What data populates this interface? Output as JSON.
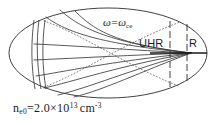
{
  "figure": {
    "name": "plasma-resonance-ray-diagram",
    "caption": {
      "symbol": "n",
      "symbol_subscript": "e0",
      "equals": "=",
      "mantissa": "2.0",
      "times": "×",
      "base": "10",
      "exponent": "13",
      "unit": "cm",
      "unit_exponent": "-3",
      "full_text": "n_e0 = 2.0 × 10^13 cm^-3"
    },
    "labels": {
      "uhr": "UHR",
      "r": "R",
      "omega_main": "ω",
      "omega_equals": "=",
      "omega_second": "ω",
      "omega_subscript": "ce",
      "omega_full": "ω = ωce"
    },
    "colors": {
      "background": "#ffffff",
      "stroke": "#2b2b2b",
      "stroke_light": "#555555",
      "dotted": "#6a6a6a"
    },
    "geometry": {
      "ellipse_cx": 108,
      "ellipse_cy": 53,
      "ellipse_rx": 99,
      "ellipse_ry": 45,
      "focus_x": 191,
      "focus_y": 53,
      "uhr_layer_x": 170,
      "r_layer_x": 187,
      "left_layer_x1": 34,
      "left_layer_x2": 45
    }
  }
}
